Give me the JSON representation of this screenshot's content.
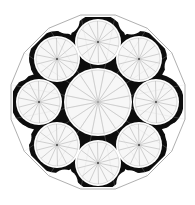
{
  "diagram": {
    "title": "",
    "canvas": {
      "width": 195,
      "height": 205,
      "background": "#ffffff"
    },
    "center": {
      "x": 98,
      "y": 102
    },
    "outer_polygon": {
      "sides": 16,
      "apothem": 87,
      "rotation_flat_top": true,
      "stroke": "#9a9a9a"
    },
    "fill_color": "#0d0d0d",
    "line_color": "#b4b4b4",
    "central_circle": {
      "cx": 98,
      "cy": 102,
      "r": 32,
      "spokes": 8
    },
    "satellite_ring_radius": 61,
    "satellite_circles": [
      {
        "name": "top",
        "cx": 98,
        "cy": 42,
        "r": 21,
        "spokes": 7
      },
      {
        "name": "upper-right",
        "cx": 139,
        "cy": 59,
        "r": 21,
        "spokes": 7
      },
      {
        "name": "right",
        "cx": 156,
        "cy": 102,
        "r": 21,
        "spokes": 7
      },
      {
        "name": "lower-right",
        "cx": 139,
        "cy": 145,
        "r": 21,
        "spokes": 7
      },
      {
        "name": "bottom",
        "cx": 98,
        "cy": 163,
        "r": 21,
        "spokes": 7
      },
      {
        "name": "lower-left",
        "cx": 57,
        "cy": 145,
        "r": 21,
        "spokes": 7
      },
      {
        "name": "left",
        "cx": 39,
        "cy": 102,
        "r": 21,
        "spokes": 7
      },
      {
        "name": "upper-left",
        "cx": 57,
        "cy": 59,
        "r": 21,
        "spokes": 7
      }
    ]
  }
}
